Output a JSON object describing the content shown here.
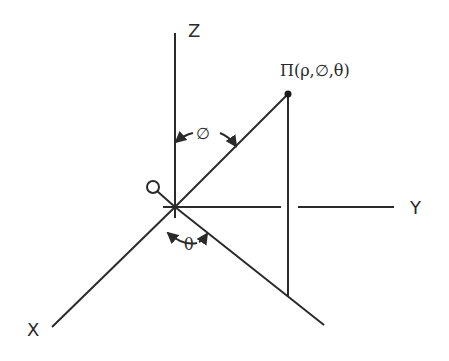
{
  "diagram": {
    "axes": {
      "x_label": "X",
      "y_label": "Y",
      "z_label": "Z"
    },
    "origin_label": "Q",
    "point_label": "Π(ρ,∅,θ)",
    "angles": {
      "polar_label": "∅",
      "azimuth_label": "θ"
    },
    "colors": {
      "stroke": "#2a2a2a",
      "background": "#ffffff"
    }
  }
}
